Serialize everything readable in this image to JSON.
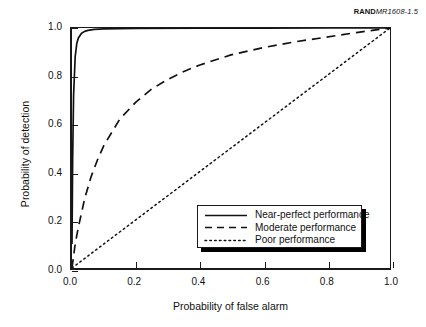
{
  "figure": {
    "source_mark": "RAND",
    "figure_number": "MR1608-1.5"
  },
  "chart_data": {
    "type": "line",
    "title": "",
    "xlabel": "Probability of false alarm",
    "ylabel": "Probability of detection",
    "xlim": [
      0.0,
      1.0
    ],
    "ylim": [
      0.0,
      1.0
    ],
    "xticks": [
      "0.0",
      "0.2",
      "0.4",
      "0.6",
      "0.8",
      "1.0"
    ],
    "yticks": [
      "0.0",
      "0.2",
      "0.4",
      "0.6",
      "0.8",
      "1.0"
    ],
    "grid": false,
    "legend_position": "lower right",
    "series": [
      {
        "name": "Near-perfect performance",
        "style": "solid",
        "color": "#111111",
        "x": [
          0.0,
          0.002,
          0.005,
          0.01,
          0.015,
          0.02,
          0.03,
          0.04,
          0.05,
          0.07,
          0.1,
          0.2,
          0.4,
          0.6,
          0.8,
          1.0
        ],
        "y": [
          0.1,
          0.45,
          0.72,
          0.88,
          0.935,
          0.958,
          0.978,
          0.986,
          0.99,
          0.994,
          0.996,
          0.998,
          0.999,
          0.999,
          1.0,
          1.0
        ]
      },
      {
        "name": "Moderate performance",
        "style": "dashed",
        "color": "#111111",
        "x": [
          0.0,
          0.01,
          0.02,
          0.04,
          0.06,
          0.08,
          0.1,
          0.15,
          0.2,
          0.25,
          0.3,
          0.35,
          0.4,
          0.5,
          0.6,
          0.7,
          0.8,
          0.9,
          1.0
        ],
        "y": [
          0.0,
          0.1,
          0.17,
          0.29,
          0.38,
          0.45,
          0.51,
          0.62,
          0.69,
          0.745,
          0.785,
          0.818,
          0.845,
          0.888,
          0.918,
          0.942,
          0.962,
          0.982,
          1.0
        ]
      },
      {
        "name": "Poor performance",
        "style": "dotted",
        "color": "#111111",
        "x": [
          0.0,
          1.0
        ],
        "y": [
          0.0,
          1.0
        ]
      }
    ]
  },
  "legend": {
    "items": [
      {
        "label": "Near-perfect performance",
        "style": "solid"
      },
      {
        "label": "Moderate performance",
        "style": "dashed"
      },
      {
        "label": "Poor performance",
        "style": "dotted"
      }
    ]
  }
}
